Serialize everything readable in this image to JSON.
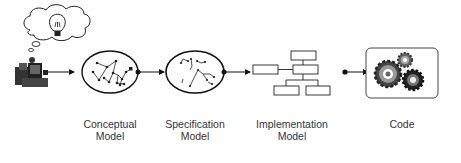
{
  "diagram": {
    "stages": [
      {
        "id": "conceptual",
        "line1": "Conceptual",
        "line2": "Model"
      },
      {
        "id": "specification",
        "line1": "Specification",
        "line2": "Model"
      },
      {
        "id": "implementation",
        "line1": "Implementation",
        "line2": "Model"
      },
      {
        "id": "code",
        "line1": "Code",
        "line2": ""
      }
    ],
    "icons": {
      "origin": "person-at-computer-icon",
      "thought": "thought-bubble-icon",
      "idea": "lightbulb-icon",
      "code": "gears-icon"
    },
    "colors": {
      "stroke": "#111111",
      "text": "#333333",
      "gear_dark": "#333333",
      "gear_light": "#888888"
    }
  }
}
